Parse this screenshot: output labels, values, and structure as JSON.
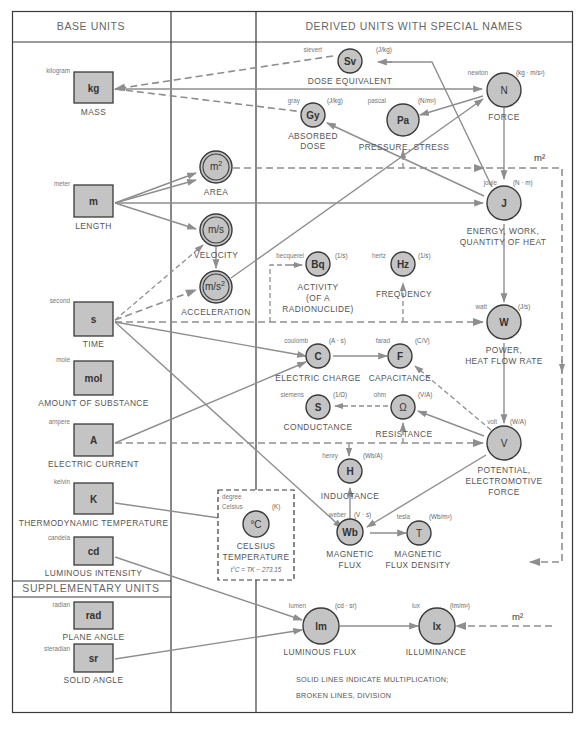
{
  "headers": {
    "base": "BASE UNITS",
    "derived": "DERIVED UNITS WITH SPECIAL NAMES",
    "supplementary": "SUPPLEMENTARY UNITS"
  },
  "base_units": [
    {
      "id": "kg",
      "name": "kilogram",
      "symbol": "kg",
      "quantity": "MASS"
    },
    {
      "id": "m",
      "name": "meter",
      "symbol": "m",
      "quantity": "LENGTH"
    },
    {
      "id": "s",
      "name": "second",
      "symbol": "s",
      "quantity": "TIME"
    },
    {
      "id": "mol",
      "name": "mole",
      "symbol": "mol",
      "quantity": "AMOUNT OF SUBSTANCE"
    },
    {
      "id": "A",
      "name": "ampere",
      "symbol": "A",
      "quantity": "ELECTRIC CURRENT"
    },
    {
      "id": "K",
      "name": "kelvin",
      "symbol": "K",
      "quantity": "THERMODYNAMIC TEMPERATURE"
    },
    {
      "id": "cd",
      "name": "candela",
      "symbol": "cd",
      "quantity": "LUMINOUS INTENSITY"
    }
  ],
  "supplementary_units": [
    {
      "id": "rad",
      "name": "radian",
      "symbol": "rad",
      "quantity": "PLANE ANGLE"
    },
    {
      "id": "sr",
      "name": "steradian",
      "symbol": "sr",
      "quantity": "SOLID ANGLE"
    }
  ],
  "intermediate_units": [
    {
      "id": "area",
      "symbol": "m",
      "sup": "2",
      "quantity": "AREA"
    },
    {
      "id": "velocity",
      "symbol": "m/s",
      "sup": "",
      "quantity": "VELOCITY"
    },
    {
      "id": "acceleration",
      "symbol": "m/s",
      "sup": "2",
      "quantity": "ACCELERATION"
    }
  ],
  "derived_units": [
    {
      "id": "Sv",
      "name": "sievert",
      "symbol": "Sv",
      "definition": "(J/kg)",
      "quantity": [
        "DOSE EQUIVALENT"
      ]
    },
    {
      "id": "Gy",
      "name": "gray",
      "symbol": "Gy",
      "definition": "(J/kg)",
      "quantity": [
        "ABSORBED",
        "DOSE"
      ]
    },
    {
      "id": "Pa",
      "name": "pascal",
      "symbol": "Pa",
      "definition": "(N/m²)",
      "quantity": [
        "PRESSURE, STRESS"
      ]
    },
    {
      "id": "N",
      "name": "newton",
      "symbol": "N",
      "definition": "(kg · m/s²)",
      "quantity": [
        "FORCE"
      ]
    },
    {
      "id": "J",
      "name": "joule",
      "symbol": "J",
      "definition": "(N · m)",
      "quantity": [
        "ENERGY, WORK,",
        "QUANTITY OF HEAT"
      ]
    },
    {
      "id": "Bq",
      "name": "becquerel",
      "symbol": "Bq",
      "definition": "(1/s)",
      "quantity": [
        "ACTIVITY",
        "(OF A",
        "RADIONUCLIDE)"
      ]
    },
    {
      "id": "Hz",
      "name": "hertz",
      "symbol": "Hz",
      "definition": "(1/s)",
      "quantity": [
        "FREQUENCY"
      ]
    },
    {
      "id": "W",
      "name": "watt",
      "symbol": "W",
      "definition": "(J/s)",
      "quantity": [
        "POWER,",
        "HEAT FLOW RATE"
      ]
    },
    {
      "id": "C",
      "name": "coulomb",
      "symbol": "C",
      "definition": "(A · s)",
      "quantity": [
        "ELECTRIC CHARGE"
      ]
    },
    {
      "id": "F",
      "name": "farad",
      "symbol": "F",
      "definition": "(C/V)",
      "quantity": [
        "CAPACITANCE"
      ]
    },
    {
      "id": "S",
      "name": "siemens",
      "symbol": "S",
      "definition": "(1/Ω)",
      "quantity": [
        "CONDUCTANCE"
      ]
    },
    {
      "id": "Ohm",
      "name": "ohm",
      "symbol": "Ω",
      "definition": "(V/A)",
      "quantity": [
        "RESISTANCE"
      ]
    },
    {
      "id": "V",
      "name": "volt",
      "symbol": "V",
      "definition": "(W/A)",
      "quantity": [
        "POTENTIAL,",
        "ELECTROMOTIVE",
        "FORCE"
      ]
    },
    {
      "id": "H",
      "name": "henry",
      "symbol": "H",
      "definition": "(Wb/A)",
      "quantity": [
        "INDUCTANCE"
      ]
    },
    {
      "id": "Wb",
      "name": "weber",
      "symbol": "Wb",
      "definition": "(V · s)",
      "quantity": [
        "MAGNETIC",
        "FLUX"
      ]
    },
    {
      "id": "T",
      "name": "tesla",
      "symbol": "T",
      "definition": "(Wb/m²)",
      "quantity": [
        "MAGNETIC",
        "FLUX DENSITY"
      ]
    },
    {
      "id": "lm",
      "name": "lumen",
      "symbol": "lm",
      "definition": "(cd · sr)",
      "quantity": [
        "LUMINOUS FLUX"
      ]
    },
    {
      "id": "lx",
      "name": "lux",
      "symbol": "lx",
      "definition": "(lm/m²)",
      "quantity": [
        "ILLUMINANCE"
      ]
    }
  ],
  "celsius": {
    "name_line1": "degree",
    "name_line2": "Celsius",
    "symbol": "°C",
    "definition": "(K)",
    "quantity": [
      "CELSIUS",
      "TEMPERATURE"
    ],
    "formula": "t°C = TK − 273.15"
  },
  "m2_labels": [
    "m²",
    "m²"
  ],
  "legend": {
    "line1": "SOLID LINES INDICATE MULTIPLICATION;",
    "line2": "BROKEN LINES, DIVISION"
  },
  "edges": [
    {
      "from": "Sv",
      "to": "kg",
      "style": "division"
    },
    {
      "from": "Gy",
      "to": "kg",
      "style": "division"
    },
    {
      "from": "kg",
      "to": "N",
      "style": "multiplication"
    },
    {
      "from": "m",
      "to": "area",
      "style": "multiplication"
    },
    {
      "from": "m",
      "to": "velocity",
      "style": "multiplication"
    },
    {
      "from": "m",
      "to": "J",
      "style": "multiplication"
    },
    {
      "from": "s",
      "to": "velocity",
      "style": "division"
    },
    {
      "from": "s",
      "to": "acceleration",
      "style": "division"
    },
    {
      "from": "velocity",
      "to": "acceleration",
      "style": "multiplication"
    },
    {
      "from": "acceleration",
      "to": "N",
      "style": "multiplication"
    },
    {
      "from": "area",
      "to": "Pa",
      "style": "division"
    },
    {
      "from": "area",
      "to": "J",
      "style": "division"
    },
    {
      "from": "area",
      "to": "T",
      "style": "division"
    },
    {
      "from": "N",
      "to": "Pa",
      "style": "multiplication"
    },
    {
      "from": "N",
      "to": "J",
      "style": "multiplication"
    },
    {
      "from": "J",
      "to": "Gy",
      "style": "multiplication"
    },
    {
      "from": "J",
      "to": "Sv",
      "style": "multiplication"
    },
    {
      "from": "J",
      "to": "W",
      "style": "multiplication"
    },
    {
      "from": "s",
      "to": "Bq",
      "style": "division"
    },
    {
      "from": "s",
      "to": "Hz",
      "style": "division"
    },
    {
      "from": "s",
      "to": "W",
      "style": "division"
    },
    {
      "from": "s",
      "to": "C",
      "style": "multiplication"
    },
    {
      "from": "s",
      "to": "Wb",
      "style": "multiplication"
    },
    {
      "from": "A",
      "to": "C",
      "style": "multiplication"
    },
    {
      "from": "A",
      "to": "V",
      "style": "division"
    },
    {
      "from": "A",
      "to": "Ohm",
      "style": "division"
    },
    {
      "from": "A",
      "to": "H",
      "style": "division"
    },
    {
      "from": "W",
      "to": "V",
      "style": "multiplication"
    },
    {
      "from": "C",
      "to": "F",
      "style": "multiplication"
    },
    {
      "from": "V",
      "to": "F",
      "style": "division"
    },
    {
      "from": "V",
      "to": "Ohm",
      "style": "multiplication"
    },
    {
      "from": "Ohm",
      "to": "S",
      "style": "division"
    },
    {
      "from": "V",
      "to": "Wb",
      "style": "multiplication"
    },
    {
      "from": "Wb",
      "to": "H",
      "style": "multiplication"
    },
    {
      "from": "Wb",
      "to": "T",
      "style": "multiplication"
    },
    {
      "from": "K",
      "to": "degC",
      "style": "multiplication"
    },
    {
      "from": "cd",
      "to": "lm",
      "style": "multiplication"
    },
    {
      "from": "sr",
      "to": "lm",
      "style": "multiplication"
    },
    {
      "from": "lm",
      "to": "lx",
      "style": "multiplication"
    },
    {
      "from": "m2",
      "to": "lx",
      "style": "division"
    }
  ]
}
